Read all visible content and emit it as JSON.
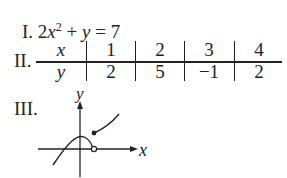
{
  "items": {
    "item1": {
      "numeral": "I.",
      "coef": "2",
      "var_x": "x",
      "exp": "2",
      "rest": " + ",
      "var_y": "y",
      "eq": " = 7"
    },
    "item2": {
      "numeral": "II.",
      "table": {
        "x_label": "x",
        "y_label": "y",
        "x_values": [
          "1",
          "2",
          "3",
          "4"
        ],
        "y_values": [
          "2",
          "5",
          "−1",
          "2"
        ]
      }
    },
    "item3": {
      "numeral": "III.",
      "graph": {
        "x_axis_label": "x",
        "y_axis_label": "y"
      }
    }
  }
}
